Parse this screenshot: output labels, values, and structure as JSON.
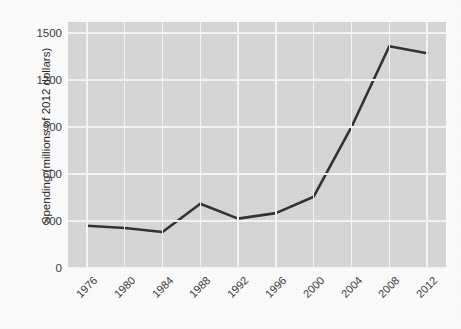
{
  "chart_data": {
    "type": "line",
    "title": "",
    "subtitle": "",
    "xlabel": "",
    "ylabel": "Spending (millions of 2012 dollars)",
    "x": [
      1976,
      1980,
      1984,
      1988,
      1992,
      1996,
      2000,
      2004,
      2008,
      2012
    ],
    "xtick_labels": [
      "1976",
      "1980",
      "1984",
      "1988",
      "1992",
      "1996",
      "2000",
      "2004",
      "2008",
      "2012"
    ],
    "ytick_labels": [
      "0",
      "300",
      "600",
      "900",
      "1200",
      "1500"
    ],
    "ytick_values": [
      0,
      300,
      600,
      900,
      1200,
      1500
    ],
    "xlim": [
      1974,
      2014
    ],
    "ylim": [
      0,
      1570
    ],
    "grid": true,
    "legend": "none",
    "series": [
      {
        "name": "Spending",
        "color": "#333333",
        "values": [
          270,
          255,
          230,
          410,
          315,
          350,
          455,
          900,
          1415,
          1370
        ]
      }
    ]
  },
  "style": {
    "panel_background": "#d6d6d6",
    "grid_color": "#f4f4f4",
    "line_color": "#333333",
    "text_color": "#3a3a3a",
    "page_background": "#fbfbfb"
  }
}
